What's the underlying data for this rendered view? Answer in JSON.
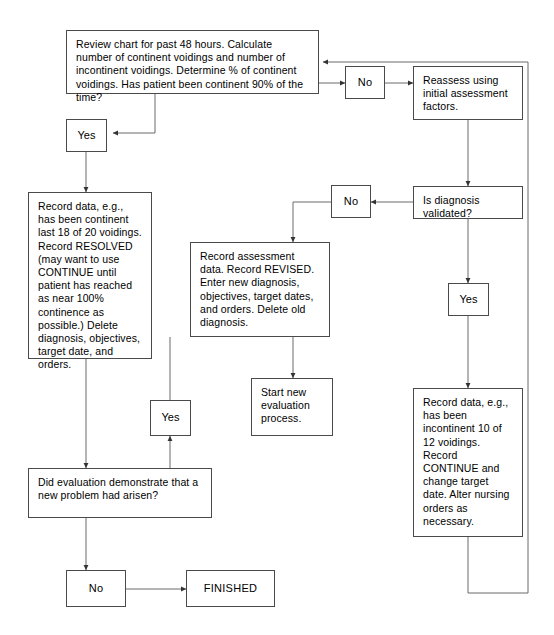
{
  "diagram": {
    "canvas": {
      "width": 554,
      "height": 635
    },
    "stroke_color": "#4a4a4a",
    "text_color": "#000000",
    "background": "#ffffff"
  },
  "nodes": {
    "review_chart": {
      "text": "Review chart for past 48 hours. Calculate number of continent voidings and number of incontinent voidings. Determine % of continent voidings. Has patient been continent 90% of the time?"
    },
    "no_top": {
      "text": "No"
    },
    "reassess": {
      "text": "Reassess using initial assessment factors."
    },
    "yes_left": {
      "text": "Yes"
    },
    "no_mid": {
      "text": "No"
    },
    "diagnosis_validated": {
      "text": "Is diagnosis validated?"
    },
    "record_resolved": {
      "text": "Record data, e.g., has been continent last 18 of 20 voidings. Record RESOLVED (may want to use CONTINUE until patient has reached as near 100% continence as possible.) Delete diagnosis, objectives, target date, and orders."
    },
    "record_revised": {
      "text": "Record assessment data. Record REVISED. Enter new diagnosis, objectives, target dates, and orders. Delete old diagnosis."
    },
    "yes_right": {
      "text": "Yes"
    },
    "start_new": {
      "text": "Start new evaluation process."
    },
    "record_continue": {
      "text": "Record data, e.g., has been incontinent 10 of 12 voidings. Record CONTINUE and change target date. Alter nursing orders as necessary."
    },
    "yes_bottom": {
      "text": "Yes"
    },
    "new_problem": {
      "text": "Did evaluation demonstrate that a new problem had arisen?"
    },
    "no_bottom": {
      "text": "No"
    },
    "finished": {
      "text": "FINISHED"
    }
  }
}
